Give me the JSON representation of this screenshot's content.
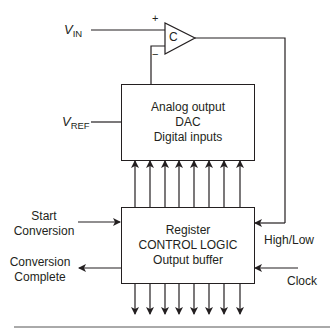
{
  "comparator": {
    "label": "C",
    "plus": "+",
    "minus": "−"
  },
  "inputs": {
    "vin": {
      "symbol": "V",
      "subscript": "IN"
    },
    "vref": {
      "symbol": "V",
      "subscript": "REF"
    }
  },
  "dac_block": {
    "lines": [
      "Analog output",
      "DAC",
      "Digital inputs"
    ]
  },
  "register_block": {
    "lines": [
      "Register",
      "CONTROL LOGIC",
      "Output buffer"
    ]
  },
  "signals": {
    "start_conversion": [
      "Start",
      "Conversion"
    ],
    "conversion_complete": [
      "Conversion",
      "Complete"
    ],
    "high_low": "High/Low",
    "clock": "Clock"
  },
  "bus": {
    "bits": 8
  },
  "colors": {
    "line": "#231f20",
    "background": "#ffffff"
  }
}
